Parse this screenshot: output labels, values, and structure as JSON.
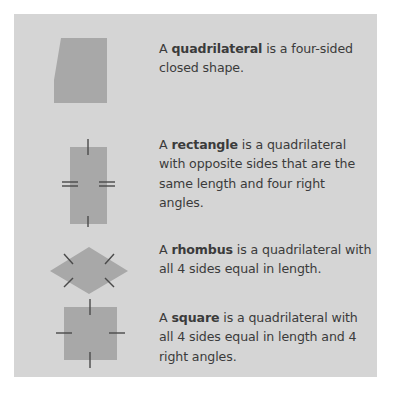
{
  "poster": {
    "background_color": "#d5d5d5",
    "page_color": "#ffffff",
    "shape_fill_color": "#a8a8a8",
    "text_color": "#3b3b3b",
    "tick_color": "#4a4a4a"
  },
  "entries": [
    {
      "id": "quadrilateral",
      "shape_name": "quadrilateral-shape",
      "article": "A ",
      "term": "quadrilateral",
      "rest": " is a four-sided closed shape.",
      "full_text": "A quadrilateral is a four-sided closed shape.",
      "tick_marks": "none"
    },
    {
      "id": "rectangle",
      "shape_name": "rectangle-shape",
      "article": "A ",
      "term": "rectangle",
      "rest": " is a quadrilateral with opposite sides that are the same length and four right angles.",
      "full_text": "A rectangle is a quadrilateral with opposite sides that are the same length and four right angles.",
      "tick_marks": "single ticks top and bottom, double ticks left and right"
    },
    {
      "id": "rhombus",
      "shape_name": "rhombus-shape",
      "article": "A ",
      "term": "rhombus",
      "rest": " is a quadrilateral with all 4 sides equal in length.",
      "full_text": "A rhombus is a quadrilateral with all 4 sides equal in length.",
      "tick_marks": "single tick on each of the 4 slanted sides"
    },
    {
      "id": "square",
      "shape_name": "square-shape",
      "article": "A ",
      "term": "square",
      "rest": " is a quadrilateral with all 4 sides equal in length and 4 right angles.",
      "full_text": "A square is a quadrilateral with all 4 sides equal in length and 4 right angles.",
      "tick_marks": "single tick on each of the 4 sides"
    }
  ]
}
